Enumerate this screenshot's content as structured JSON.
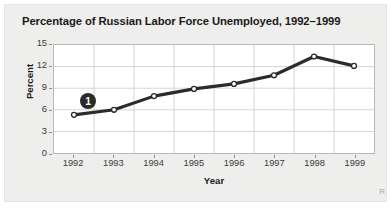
{
  "chart_data": {
    "type": "line",
    "title": "Percentage of Russian Labor Force Unemployed, 1992–1999",
    "xlabel": "Year",
    "ylabel": "Percent",
    "categories": [
      "1992",
      "1993",
      "1994",
      "1995",
      "1996",
      "1997",
      "1998",
      "1999"
    ],
    "values": [
      5.3,
      6.0,
      7.9,
      8.9,
      9.6,
      10.8,
      13.4,
      12.1
    ],
    "series": [
      {
        "name": "Unemployment rate",
        "values": [
          5.3,
          6.0,
          7.9,
          8.9,
          9.6,
          10.8,
          13.4,
          12.1
        ]
      }
    ],
    "ylim": [
      0,
      15
    ],
    "yticks": [
      0,
      3,
      6,
      9,
      12,
      15
    ],
    "ytick_labels": [
      "0",
      "3",
      "6",
      "9",
      "12",
      "15"
    ],
    "xtick_labels": [
      "1992",
      "1993",
      "1994",
      "1995",
      "1996",
      "1997",
      "1998",
      "1999"
    ],
    "grid": true,
    "legend": "none",
    "line_color": "#2b2b2b",
    "marker": "open-circle",
    "marker_face_color": "#ffffff",
    "grid_color": "#d3d3d0",
    "plot_background": "#ffffff",
    "figure_background": "#eeeeec",
    "annotations": [
      {
        "label": "1",
        "at_category": "1992",
        "note": "numbered callout badge above the 1992 data point"
      }
    ]
  },
  "figure": {
    "corner_mark": "R"
  }
}
